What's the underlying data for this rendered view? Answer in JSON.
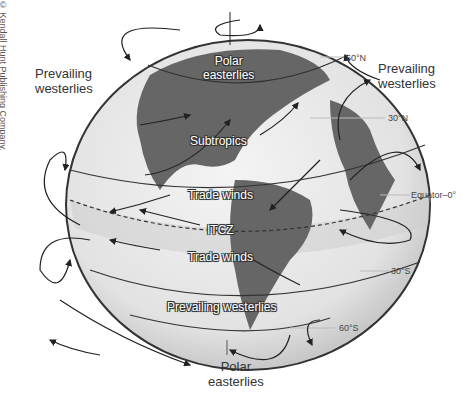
{
  "copyright": "© Kendall Hunt Publishing Company.",
  "outer_labels": {
    "top_left": {
      "line1": "Prevailing",
      "line2": "westerlies"
    },
    "top_right": {
      "line1": "Prevailing",
      "line2": "westerlies"
    },
    "bottom": {
      "line1": "Polar",
      "line2": "easterlies"
    }
  },
  "globe_labels": {
    "polar_n": {
      "line1": "Polar",
      "line2": "easterlies"
    },
    "subtropics": "Subtropics",
    "trade_n": "Trade winds",
    "itcz": "ITCZ",
    "trade_s": "Trade winds",
    "westerlies_s": "Prevailing westerlies"
  },
  "latitudes": {
    "n60": "60°N",
    "n30": "30°N",
    "equator": "Equator–0°",
    "s30": "30°S",
    "s60": "60°S"
  }
}
